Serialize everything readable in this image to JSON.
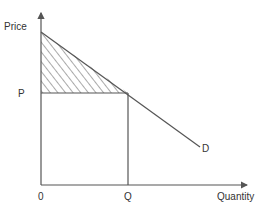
{
  "diagram": {
    "labels": {
      "y_axis": "Price",
      "x_axis": "Quantity",
      "origin": "0",
      "price_level": "P",
      "quantity_level": "Q",
      "demand_curve": "D"
    },
    "colors": {
      "line": "#555555",
      "hatch": "#555555",
      "text": "#333333",
      "background": "#ffffff"
    },
    "shaded_region": "consumer-surplus-triangle (hatched)"
  }
}
